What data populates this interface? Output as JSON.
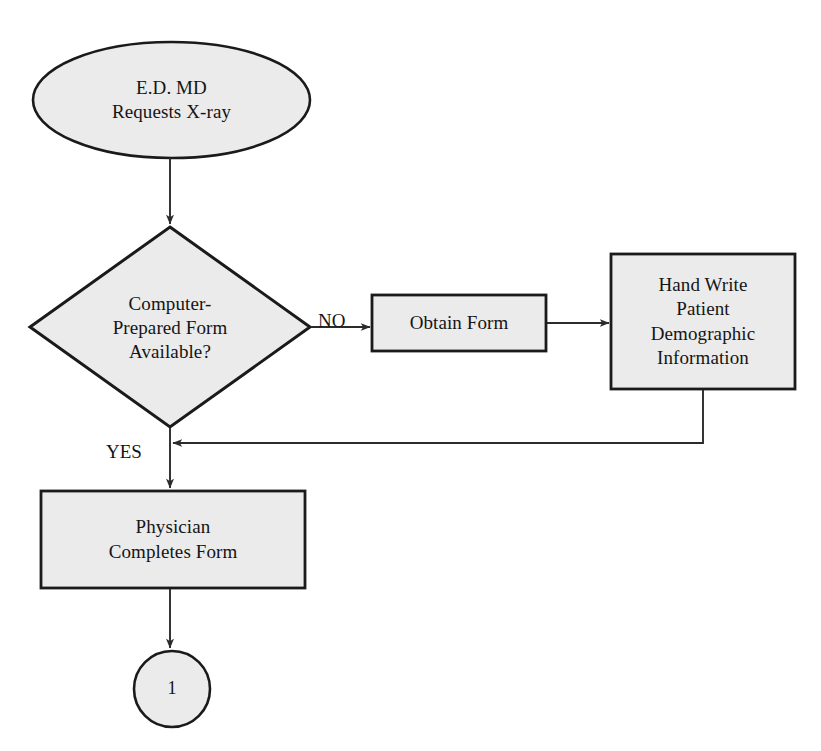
{
  "diagram": {
    "type": "flowchart",
    "colors": {
      "shape_fill": "#ebebeb",
      "shape_stroke": "#1a1a1a",
      "connector_stroke": "#2b2b2b",
      "text": "#151515",
      "background": "#ffffff"
    },
    "nodes": {
      "start": {
        "shape": "ellipse",
        "label": "E.D. MD\nRequests X-ray"
      },
      "decision": {
        "shape": "diamond",
        "label": "Computer-\nPrepared Form\nAvailable?"
      },
      "obtain_form": {
        "shape": "rectangle",
        "label": "Obtain  Form"
      },
      "hand_write": {
        "shape": "rectangle",
        "label": "Hand Write\nPatient\nDemographic\nInformation"
      },
      "physician": {
        "shape": "rectangle",
        "label": "Physician\nCompletes Form"
      },
      "connector": {
        "shape": "circle",
        "label": "1"
      }
    },
    "edges": [
      {
        "id": "start-to-decision",
        "label": ""
      },
      {
        "id": "decision-to-obtain",
        "label": "NO"
      },
      {
        "id": "obtain-to-handwrite",
        "label": ""
      },
      {
        "id": "handwrite-return",
        "label": ""
      },
      {
        "id": "decision-to-physician",
        "label": "YES"
      },
      {
        "id": "physician-to-connector",
        "label": ""
      }
    ],
    "edge_labels": {
      "no": "NO",
      "yes": "YES"
    }
  }
}
